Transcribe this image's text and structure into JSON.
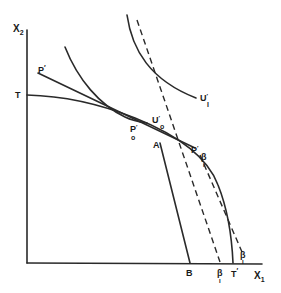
{
  "diagram": {
    "type": "economics-production-possibility-diagram",
    "axes": {
      "y_label": "X",
      "y_sub": "2",
      "x_label": "X",
      "x_sub": "1"
    },
    "labels": {
      "T": "T",
      "T_prime": "T",
      "T_prime_mark": "′",
      "P_prime": "P",
      "P_prime_mark": "′",
      "P0_prime": "P",
      "P0_sub": "o",
      "P0_mark": "′",
      "P1_prime": "P",
      "P1_sub": "I",
      "P1_mark": "′",
      "U0_prime": "U",
      "U0_sub": "o",
      "U0_mark": "′",
      "U1_prime": "U",
      "U1_sub": "I",
      "U1_mark": "′",
      "A": "A",
      "B": "B",
      "beta1_upper": "β",
      "beta1_upper_sub": "I",
      "beta1_axis": "β",
      "beta1_axis_sub": "I",
      "beta1_lower": "β",
      "beta1_lower_sub": "I"
    },
    "colors": {
      "ink": "#2a2a2a",
      "background": "#ffffff"
    }
  }
}
